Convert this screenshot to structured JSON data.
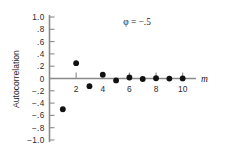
{
  "chart_data": {
    "type": "scatter",
    "title": "",
    "annotation": "φ = −.5",
    "xlabel": "m",
    "ylabel": "Autocorrelation",
    "x": [
      1,
      2,
      3,
      4,
      5,
      6,
      7,
      8,
      9,
      10
    ],
    "values": [
      -0.5,
      0.25,
      -0.125,
      0.0625,
      -0.031,
      0.016,
      -0.008,
      0.004,
      -0.002,
      0.001
    ],
    "series": [
      {
        "name": "Autocorrelation",
        "values": [
          -0.5,
          0.25,
          -0.125,
          0.0625,
          -0.031,
          0.016,
          -0.008,
          0.004,
          -0.002,
          0.001
        ]
      }
    ],
    "xlim": [
      0,
      11
    ],
    "ylim": [
      -1.0,
      1.0
    ],
    "grid": false,
    "legend": "none",
    "x_tick_values": [
      2,
      4,
      6,
      8,
      10
    ],
    "x_tick_labels": [
      "2",
      "4",
      "6",
      "8",
      "10"
    ],
    "y_tick_values": [
      1.0,
      0.8,
      0.6,
      0.4,
      0.2,
      0.0,
      -0.2,
      -0.4,
      -0.6,
      -0.8,
      -1.0
    ],
    "y_tick_labels": [
      "1.0",
      ".8",
      ".6",
      ".4",
      ".2",
      "0",
      "−.2",
      "−.4",
      "−.6",
      "−.8",
      "−1.0"
    ],
    "marker": "filled-circle",
    "marker_color": "#111111",
    "axis_color": "#8a8a8a",
    "background_color": "#ffffff"
  }
}
